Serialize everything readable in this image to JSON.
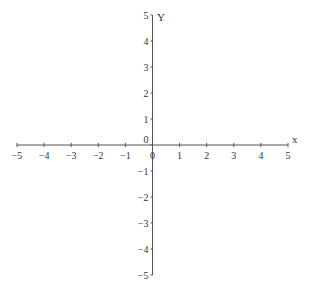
{
  "chart_data": {
    "type": "line",
    "title": "",
    "xlabel": "x",
    "ylabel": "Y",
    "xlim": [
      -5,
      5
    ],
    "ylim": [
      -5,
      5
    ],
    "x_ticks": [
      -5,
      -4,
      -3,
      -2,
      -1,
      0,
      1,
      2,
      3,
      4,
      5
    ],
    "y_ticks": [
      -5,
      -4,
      -3,
      -2,
      -1,
      0,
      1,
      2,
      3,
      4,
      5
    ],
    "x_tick_labels": [
      "−5",
      "−4",
      "−3",
      "−2",
      "−1",
      "0",
      "1",
      "2",
      "3",
      "4",
      "5"
    ],
    "y_tick_labels": [
      "−5",
      "−4",
      "−3",
      "−2",
      "−1",
      "0",
      "1",
      "2",
      "3",
      "4",
      "5"
    ],
    "series": [],
    "grid": false,
    "legend": null,
    "axis_color": "#555555"
  }
}
